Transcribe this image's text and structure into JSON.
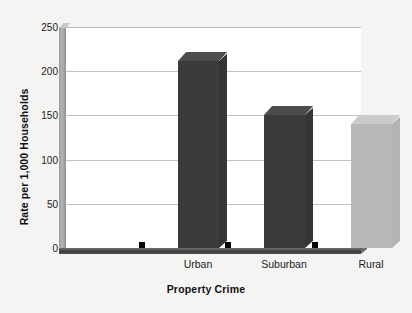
{
  "chart_data": {
    "type": "bar",
    "title": "",
    "subtitle": "",
    "xlabel": "Property Crime",
    "ylabel": "Rate per 1,000 Households",
    "categories": [
      "Urban",
      "Suburban",
      "Rural"
    ],
    "values": [
      211,
      150,
      140
    ],
    "ylim": [
      0,
      250
    ],
    "ytick_values": [
      0,
      50,
      100,
      150,
      200,
      250
    ],
    "ytick_labels": [
      "0",
      "50",
      "100",
      "150",
      "200",
      "250"
    ],
    "grid": true,
    "legend": "none",
    "style": "3d-bar",
    "series": [
      {
        "name": "Property Crime Rate",
        "values": [
          211,
          150,
          140
        ]
      }
    ],
    "bar_colors": [
      "#3b3b3b",
      "#3b3b3b",
      "#b9b9b9"
    ],
    "colors": {
      "background": "#f4f4f2",
      "plot_background": "#ffffff",
      "gridline": "#c2c2c2",
      "axis": "#4a4a4a",
      "dark_bar": "#3b3b3b",
      "light_bar": "#b9b9b9",
      "shadow": "#c9c9c9",
      "text": "#1a1a1a"
    }
  }
}
